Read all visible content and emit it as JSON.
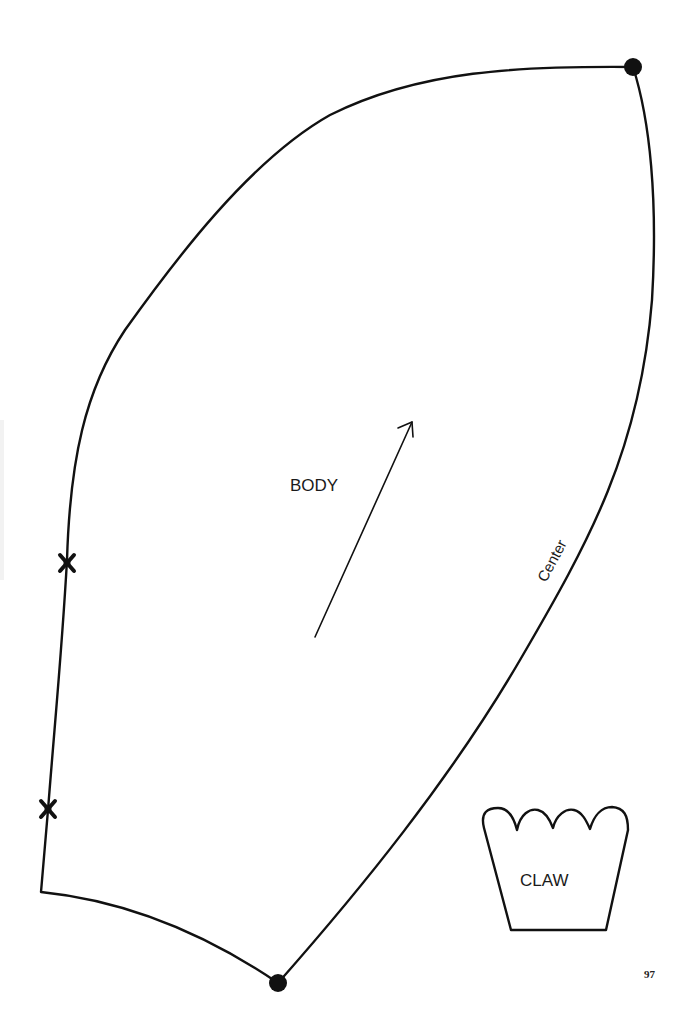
{
  "pieces": {
    "body": {
      "label": "BODY",
      "center_label": "Center",
      "grainline": "arrow",
      "dots": 2,
      "notches": 2
    },
    "claw": {
      "label": "CLAW"
    }
  },
  "page_number": "97",
  "colors": {
    "line": "#111111",
    "background": "#ffffff"
  }
}
